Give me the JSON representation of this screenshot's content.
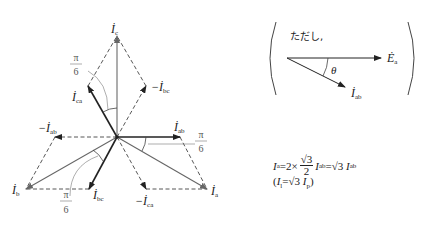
{
  "phasor_diagram": {
    "center": [
      117,
      137
    ],
    "solid_vectors": [
      {
        "name": "I_c",
        "label": "İ",
        "sub": "c",
        "tip": [
          117,
          36
        ],
        "color": "#999999",
        "weight": 1.6
      },
      {
        "name": "I_a",
        "label": "İ",
        "sub": "a",
        "tip": [
          207,
          189
        ],
        "color": "#666666",
        "weight": 1.2
      },
      {
        "name": "I_b",
        "label": "İ",
        "sub": "b",
        "tip": [
          26,
          189
        ],
        "color": "#666666",
        "weight": 1.2
      },
      {
        "name": "I_ab",
        "label": "İ",
        "sub": "ab",
        "tip": [
          180,
          137
        ],
        "color": "#222222",
        "weight": 1.6
      },
      {
        "name": "I_ca",
        "label": "İ",
        "sub": "ca",
        "tip": [
          88,
          86
        ],
        "color": "#222222",
        "weight": 1.6
      },
      {
        "name": "I_bc",
        "label": "İ",
        "sub": "bc",
        "tip": [
          89,
          189
        ],
        "color": "#222222",
        "weight": 1.6
      }
    ],
    "dashed_vectors": [
      {
        "name": "-I_ab",
        "label": "−İ",
        "sub": "ab",
        "tip": [
          55,
          137
        ]
      },
      {
        "name": "-I_bc",
        "label": "−İ",
        "sub": "bc",
        "tip": [
          146,
          86
        ]
      },
      {
        "name": "-I_ca",
        "label": "−İ",
        "sub": "ca",
        "tip": [
          146,
          189
        ]
      }
    ],
    "labels": {
      "ic": {
        "main": "İ",
        "sub": "c"
      },
      "ia": {
        "main": "İ",
        "sub": "a"
      },
      "ib": {
        "main": "İ",
        "sub": "b"
      },
      "iab": {
        "main": "İ",
        "sub": "ab"
      },
      "ica": {
        "main": "İ",
        "sub": "ca"
      },
      "ibc": {
        "main": "İ",
        "sub": "bc"
      },
      "neg_iab": {
        "main": "−İ",
        "sub": "ab"
      },
      "neg_ibc": {
        "main": "−İ",
        "sub": "bc"
      },
      "neg_ica": {
        "main": "−İ",
        "sub": "ca"
      }
    },
    "angle_labels": [
      {
        "num": "π",
        "den": "6",
        "position": "upper-left"
      },
      {
        "num": "π",
        "den": "6",
        "position": "right"
      },
      {
        "num": "π",
        "den": "6",
        "position": "lower-left"
      }
    ]
  },
  "inset": {
    "note": "ただし,",
    "vector_e": {
      "main": "Ė",
      "sub": "a"
    },
    "vector_i": {
      "main": "İ",
      "sub": "ab"
    },
    "angle": "θ"
  },
  "formula": {
    "line1_lhs": "I",
    "line1_lhs_sub": "a",
    "line1_eq1": "=2×",
    "frac_num": "√3",
    "frac_den": "2",
    "line1_mid": "I",
    "line1_mid_sub": "ab",
    "line1_eq2": "=√3 ",
    "line1_rhs": "I",
    "line1_rhs_sub": "ab",
    "line2_open": "(",
    "line2_a": "I",
    "line2_a_sub": "l",
    "line2_eq": "=√3 ",
    "line2_b": "I",
    "line2_b_sub": "p",
    "line2_close": ")"
  }
}
